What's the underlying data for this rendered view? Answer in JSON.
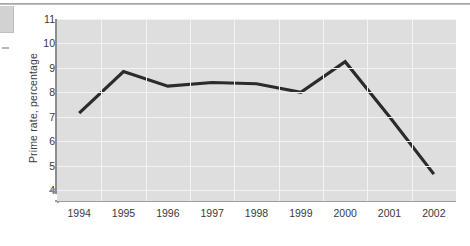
{
  "chart_data": {
    "type": "line",
    "title": "",
    "xlabel": "",
    "ylabel": "Prime rate, percentage",
    "categories": [
      "1994",
      "1995",
      "1996",
      "1997",
      "1998",
      "1999",
      "2000",
      "2001",
      "2002"
    ],
    "values": [
      7.15,
      8.85,
      8.25,
      8.4,
      8.35,
      8.0,
      9.25,
      7.0,
      4.65
    ],
    "series": [
      {
        "name": "Prime rate",
        "values": [
          7.15,
          8.85,
          8.25,
          8.4,
          8.35,
          8.0,
          9.25,
          7.0,
          4.65
        ],
        "color": "#2b2b2b"
      }
    ],
    "ylim": [
      3.55,
      11
    ],
    "yticks": [
      4,
      5,
      6,
      7,
      8,
      9,
      10,
      11
    ],
    "ytick_labels": [
      "4",
      "5",
      "6",
      "7",
      "8",
      "9",
      "10",
      "11"
    ],
    "xtick_labels": [
      "1994",
      "1995",
      "1996",
      "1997",
      "1998",
      "1999",
      "2000",
      "2001",
      "2002"
    ],
    "grid": true,
    "legend": "none",
    "axis_break": true,
    "plot_background": "#dedede",
    "grid_color": "#f3f3f3",
    "axis_color": "#8e8e8e"
  },
  "figure": {
    "y_axis_label": "Prime rate, percentage"
  }
}
